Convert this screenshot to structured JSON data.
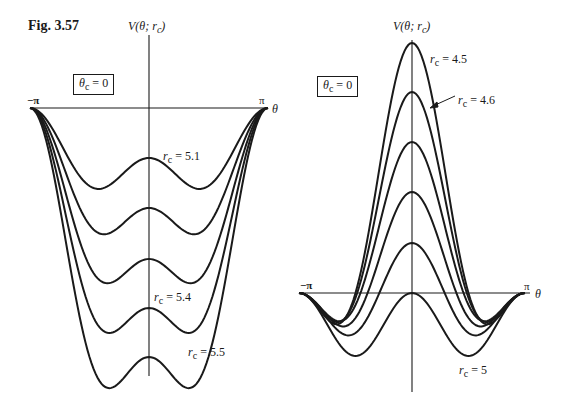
{
  "figure": {
    "title": "Fig. 3.57"
  },
  "chart_data": [
    {
      "type": "line",
      "title": "",
      "xlabel": "θ",
      "ylabel": "V(θ; r_c)",
      "annotation_box": "θ_c = 0",
      "x_tick_labels": [
        "−π",
        "π"
      ],
      "xlim": [
        -3.1416,
        3.1416
      ],
      "grid": false,
      "legend": "inline labels",
      "description": "Potential curves, all zero at θ = ±π, with a central local maximum (double-well) that flattens as r_c increases",
      "series": [
        {
          "name": "r_c = 5.1",
          "label_visible": true,
          "center_value_rel": -0.5,
          "side_min_rel": -0.78
        },
        {
          "name": "r_c = 5.2",
          "label_visible": false,
          "center_value_rel": -1.0,
          "side_min_rel": -1.17
        },
        {
          "name": "r_c = 5.3",
          "label_visible": false,
          "center_value_rel": -1.51,
          "side_min_rel": -1.58
        },
        {
          "name": "r_c = 5.4",
          "label_visible": true,
          "center_value_rel": -2.0,
          "side_min_rel": -2.0
        },
        {
          "name": "r_c = 5.5",
          "label_visible": true,
          "center_value_rel": -2.49,
          "side_min_rel": -2.49
        }
      ]
    },
    {
      "type": "line",
      "title": "",
      "xlabel": "θ",
      "ylabel": "V(θ; r_c)",
      "annotation_box": "θ_c = 0",
      "x_tick_labels": [
        "−π",
        "π"
      ],
      "xlim": [
        -3.1416,
        3.1416
      ],
      "grid": false,
      "legend": "inline labels",
      "description": "Potential curves, all zero at θ = ±π, with central peak decreasing as r_c increases",
      "series": [
        {
          "name": "r_c = 4.5",
          "label_visible": true,
          "center_value_rel": 2.5,
          "side_min_rel": 0.0
        },
        {
          "name": "r_c = 4.6",
          "label_visible": true,
          "center_value_rel": 2.01,
          "side_min_rel": -0.05
        },
        {
          "name": "r_c = 4.7",
          "label_visible": false,
          "center_value_rel": 1.51,
          "side_min_rel": -0.12
        },
        {
          "name": "r_c = 4.8",
          "label_visible": false,
          "center_value_rel": 1.01,
          "side_min_rel": -0.25
        },
        {
          "name": "r_c = 4.9",
          "label_visible": false,
          "center_value_rel": 0.5,
          "side_min_rel": -0.4
        },
        {
          "name": "r_c = 5",
          "label_visible": true,
          "center_value_rel": 0.0,
          "side_min_rel": -0.63
        }
      ]
    }
  ],
  "left_plot": {
    "y_axis_label": "V(θ; r",
    "y_axis_sub": "c",
    "y_axis_close": ")",
    "box_label": "θ",
    "box_sub": "c",
    "box_value": " = 0",
    "neg_pi": "−π",
    "pi": "π",
    "theta": "θ",
    "labels": [
      {
        "r": "r",
        "sub": "c",
        "value": " = 5.1"
      },
      {
        "r": "r",
        "sub": "c",
        "value": " = 5.4"
      },
      {
        "r": "r",
        "sub": "c",
        "value": " = 5.5"
      }
    ]
  },
  "right_plot": {
    "y_axis_label": "V(θ; r",
    "y_axis_sub": "c",
    "y_axis_close": ")",
    "box_label": "θ",
    "box_sub": "c",
    "box_value": " = 0",
    "neg_pi": "−π",
    "pi": "π",
    "theta": "θ",
    "labels": [
      {
        "r": "r",
        "sub": "c",
        "value": " = 4.5"
      },
      {
        "r": "r",
        "sub": "c",
        "value": " = 4.6"
      },
      {
        "r": "r",
        "sub": "c",
        "value": " = 5"
      }
    ]
  },
  "colors": {
    "ink": "#1a1a1a",
    "background": "#ffffff"
  }
}
